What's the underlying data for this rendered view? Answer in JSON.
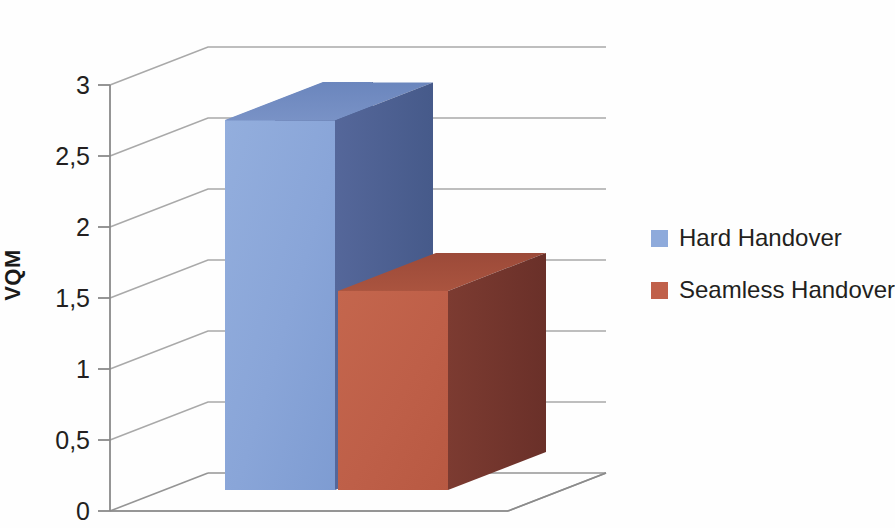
{
  "chart_data": {
    "type": "bar",
    "title": "",
    "subtitle": "",
    "xlabel": "",
    "ylabel": "VQM",
    "categories": [
      "1"
    ],
    "ylim": [
      0,
      3
    ],
    "ytick_values": [
      0,
      0.5,
      1,
      1.5,
      2,
      2.5,
      3
    ],
    "ytick_labels": [
      "0",
      "0,5",
      "1",
      "1,5",
      "2",
      "2,5",
      "3"
    ],
    "grid": true,
    "grid_axis": "y",
    "three_d": true,
    "legend_position": "right",
    "series": [
      {
        "name": "Hard Handover",
        "values": [
          2.75
        ],
        "color": "#8EAADB",
        "color_top": "#6E8CC4",
        "color_side": "#4A5F8E"
      },
      {
        "name": "Seamless Handover",
        "values": [
          1.55
        ],
        "color": "#C0604A",
        "color_top": "#A24E3C",
        "color_side": "#70342C"
      }
    ],
    "annotations": []
  },
  "axis": {
    "title": "VQM",
    "ticks": [
      {
        "label": "3",
        "value": 3.0
      },
      {
        "label": "2,5",
        "value": 2.5
      },
      {
        "label": "2",
        "value": 2.0
      },
      {
        "label": "1,5",
        "value": 1.5
      },
      {
        "label": "1",
        "value": 1.0
      },
      {
        "label": "0,5",
        "value": 0.5
      },
      {
        "label": "0",
        "value": 0.0
      }
    ]
  },
  "legend": {
    "entries": [
      {
        "label": "Hard Handover",
        "color": "#8EAADB"
      },
      {
        "label": "Seamless Handover",
        "color": "#C0604A"
      }
    ]
  },
  "colors": {
    "background": "#fefefe",
    "gridline": "#9b9b9b",
    "axis": "#8a8a8a",
    "text": "#231f20",
    "series_1_front": "#8EAADB",
    "series_1_top": "#6E8CC4",
    "series_1_side": "#4A5F8E",
    "series_2_front": "#C0604A",
    "series_2_top": "#A24E3C",
    "series_2_side": "#70342C"
  }
}
